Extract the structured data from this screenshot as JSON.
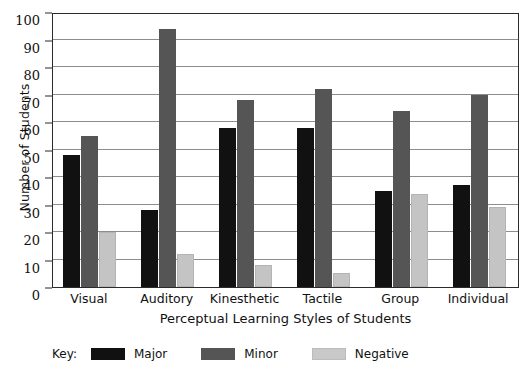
{
  "chart_data": {
    "type": "bar",
    "title": "",
    "xlabel": "Perceptual Learning Styles of Students",
    "ylabel": "Number of Students",
    "ylim": [
      0,
      100
    ],
    "ytick_step": 10,
    "yticks": [
      0,
      10,
      20,
      30,
      40,
      50,
      60,
      70,
      80,
      90,
      100
    ],
    "grid": true,
    "legend_position": "bottom-left",
    "legend_prefix": "Key:",
    "categories": [
      "Visual",
      "Auditory",
      "Kinesthetic",
      "Tactile",
      "Group",
      "Individual"
    ],
    "series": [
      {
        "name": "Major",
        "color": "#111111",
        "values": [
          48,
          28,
          58,
          58,
          35,
          37
        ]
      },
      {
        "name": "Minor",
        "color": "#555555",
        "values": [
          55,
          94,
          68,
          72,
          64,
          70
        ]
      },
      {
        "name": "Negative",
        "color": "#c4c4c4",
        "values": [
          20,
          12,
          8,
          5,
          34,
          29
        ]
      }
    ]
  }
}
